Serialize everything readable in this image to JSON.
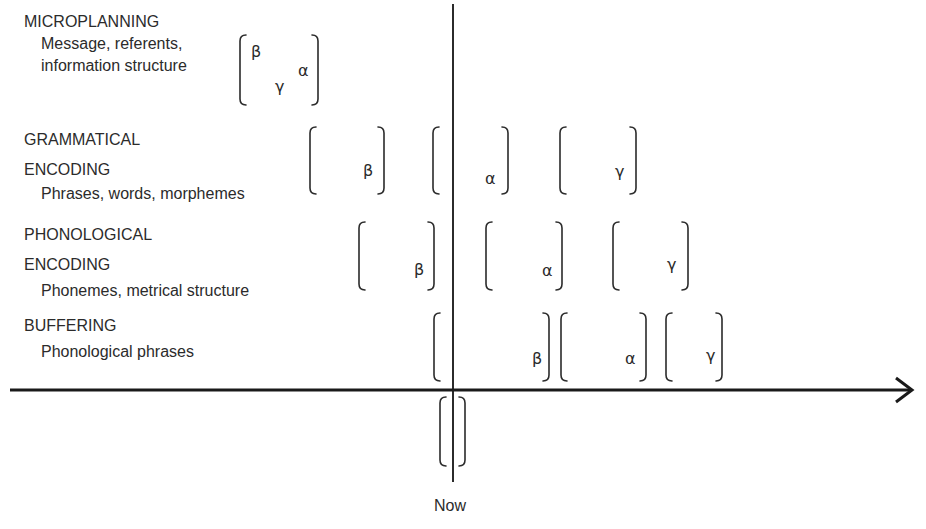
{
  "diagram": {
    "title": "",
    "axis_label_now": "Now",
    "levels": [
      {
        "heading": [
          "MICROPLANNING"
        ],
        "subtext": [
          "Message, referents,",
          "information structure"
        ],
        "units": [
          {
            "symbols": [
              {
                "char": "β",
                "x": 251,
                "y": 43
              },
              {
                "char": "γ",
                "x": 275,
                "y": 78
              },
              {
                "char": "α",
                "x": 298,
                "y": 62
              }
            ],
            "x1": 240,
            "x2": 318,
            "y1": 35,
            "y2": 105
          }
        ]
      },
      {
        "heading": [
          "GRAMMATICAL",
          "ENCODING"
        ],
        "subtext": [
          "Phrases, words, morphemes"
        ],
        "units": [
          {
            "symbols": [
              {
                "char": "β",
                "x": 363,
                "y": 162
              }
            ],
            "x1": 310,
            "x2": 384,
            "y1": 127,
            "y2": 194
          },
          {
            "symbols": [
              {
                "char": "α",
                "x": 485,
                "y": 170
              }
            ],
            "x1": 433,
            "x2": 508,
            "y1": 127,
            "y2": 194
          },
          {
            "symbols": [
              {
                "char": "γ",
                "x": 615,
                "y": 163
              }
            ],
            "x1": 560,
            "x2": 636,
            "y1": 127,
            "y2": 194
          }
        ]
      },
      {
        "heading": [
          "PHONOLOGICAL",
          "ENCODING"
        ],
        "subtext": [
          "Phonemes, metrical structure"
        ],
        "units": [
          {
            "symbols": [
              {
                "char": "β",
                "x": 414,
                "y": 261
              }
            ],
            "x1": 359,
            "x2": 434,
            "y1": 222,
            "y2": 290
          },
          {
            "symbols": [
              {
                "char": "α",
                "x": 542,
                "y": 262
              }
            ],
            "x1": 486,
            "x2": 562,
            "y1": 222,
            "y2": 290
          },
          {
            "symbols": [
              {
                "char": "γ",
                "x": 667,
                "y": 256
              }
            ],
            "x1": 613,
            "x2": 688,
            "y1": 222,
            "y2": 290
          }
        ]
      },
      {
        "heading": [
          "BUFFERING"
        ],
        "subtext": [
          "Phonological phrases"
        ],
        "units": [
          {
            "symbols": [
              {
                "char": "β",
                "x": 532,
                "y": 350
              }
            ],
            "x1": 434,
            "x2": 549,
            "y1": 313,
            "y2": 381
          },
          {
            "symbols": [
              {
                "char": "α",
                "x": 625,
                "y": 350
              }
            ],
            "x1": 561,
            "x2": 646,
            "y1": 313,
            "y2": 381
          },
          {
            "symbols": [
              {
                "char": "γ",
                "x": 706,
                "y": 347
              }
            ],
            "x1": 666,
            "x2": 722,
            "y1": 313,
            "y2": 381
          }
        ]
      }
    ],
    "now_bracket": {
      "x1": 440,
      "x2": 465,
      "y1": 397,
      "y2": 466
    },
    "time_axis": {
      "y": 390,
      "x1": 10,
      "x2": 912
    },
    "now_line": {
      "x": 453,
      "y1": 4,
      "y2": 482
    },
    "colors": {
      "ink": "#2b2b2b",
      "background": "#ffffff"
    }
  }
}
